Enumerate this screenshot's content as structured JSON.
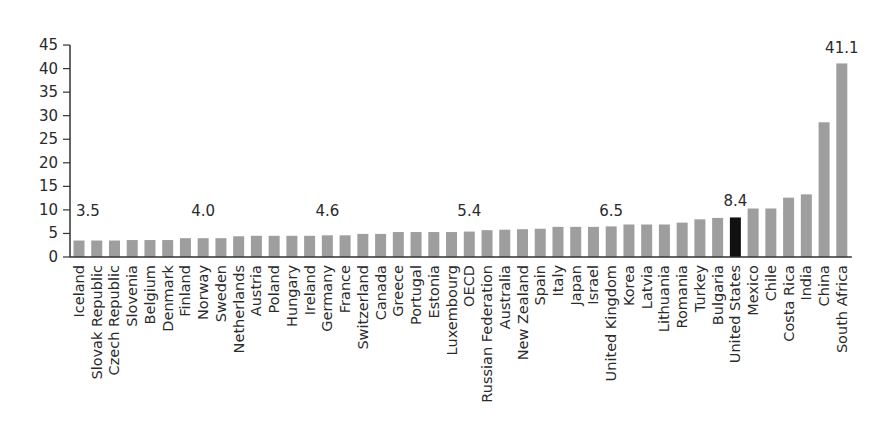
{
  "chart_data": {
    "type": "bar",
    "title": "",
    "xlabel": "",
    "ylabel": "",
    "ylim": [
      0,
      45
    ],
    "yticks": [
      0,
      5,
      10,
      15,
      20,
      25,
      30,
      35,
      40,
      45
    ],
    "grid": false,
    "legend": null,
    "categories": [
      "Iceland",
      "Slovak Republic",
      "Czech Republic",
      "Slovenia",
      "Belgium",
      "Denmark",
      "Finland",
      "Norway",
      "Sweden",
      "Netherlands",
      "Austria",
      "Poland",
      "Hungary",
      "Ireland",
      "Germany",
      "France",
      "Switzerland",
      "Canada",
      "Greece",
      "Portugal",
      "Estonia",
      "Luxembourg",
      "OECD",
      "Russian Federation",
      "Australia",
      "New Zealand",
      "Spain",
      "Italy",
      "Japan",
      "Israel",
      "United Kingdom",
      "Korea",
      "Latvia",
      "Lithuania",
      "Romania",
      "Turkey",
      "Bulgaria",
      "United States",
      "Mexico",
      "Chile",
      "Costa Rica",
      "India",
      "China",
      "South Africa"
    ],
    "values": [
      3.5,
      3.5,
      3.5,
      3.6,
      3.6,
      3.6,
      4.0,
      4.0,
      4.0,
      4.4,
      4.5,
      4.5,
      4.5,
      4.5,
      4.6,
      4.6,
      4.9,
      4.9,
      5.3,
      5.3,
      5.3,
      5.3,
      5.4,
      5.7,
      5.8,
      5.9,
      6.0,
      6.4,
      6.4,
      6.4,
      6.5,
      6.9,
      6.9,
      6.9,
      7.3,
      8.0,
      8.3,
      8.4,
      10.3,
      10.3,
      12.6,
      13.3,
      28.6,
      41.1
    ],
    "highlight": {
      "category": "United States",
      "color": "#111111"
    },
    "bar_color": "#9e9e9e",
    "annotations": [
      {
        "category": "Iceland",
        "text": "3.5"
      },
      {
        "category": "Norway",
        "text": "4.0"
      },
      {
        "category": "Germany",
        "text": "4.6"
      },
      {
        "category": "OECD",
        "text": "5.4"
      },
      {
        "category": "United Kingdom",
        "text": "6.5"
      },
      {
        "category": "United States",
        "text": "8.4"
      },
      {
        "category": "South Africa",
        "text": "41.1"
      }
    ]
  }
}
